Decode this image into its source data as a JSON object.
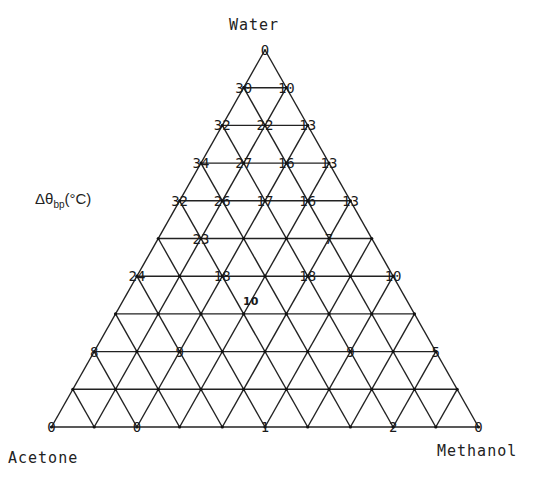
{
  "diagram": {
    "type": "ternary-grid",
    "subdivisions": 10,
    "line_color": "#222222",
    "vertices": {
      "top": "Water",
      "bottom_left": "Acetone",
      "bottom_right": "Methanol"
    },
    "axis_title": {
      "prefix": "Δθ",
      "subscript": "bp",
      "suffix": "(°C)"
    },
    "node_values": [
      {
        "row": 0,
        "col": 0,
        "value": "0"
      },
      {
        "row": 1,
        "col": 0,
        "value": "30"
      },
      {
        "row": 1,
        "col": 1,
        "value": "10"
      },
      {
        "row": 2,
        "col": 0,
        "value": "32"
      },
      {
        "row": 2,
        "col": 1,
        "value": "22"
      },
      {
        "row": 2,
        "col": 2,
        "value": "13"
      },
      {
        "row": 3,
        "col": 0,
        "value": "34"
      },
      {
        "row": 3,
        "col": 1,
        "value": "27"
      },
      {
        "row": 3,
        "col": 2,
        "value": "16"
      },
      {
        "row": 3,
        "col": 3,
        "value": "13"
      },
      {
        "row": 4,
        "col": 0,
        "value": "32"
      },
      {
        "row": 4,
        "col": 1,
        "value": "26"
      },
      {
        "row": 4,
        "col": 2,
        "value": "17"
      },
      {
        "row": 4,
        "col": 3,
        "value": "16"
      },
      {
        "row": 4,
        "col": 4,
        "value": "13"
      },
      {
        "row": 5,
        "col": 1,
        "value": "23"
      },
      {
        "row": 5,
        "col": 4,
        "value": "7"
      },
      {
        "row": 6,
        "col": 0,
        "value": "24"
      },
      {
        "row": 6,
        "col": 2,
        "value": "18"
      },
      {
        "row": 6,
        "col": 4,
        "value": "18"
      },
      {
        "row": 6,
        "col": 6,
        "value": "10"
      },
      {
        "row": 8,
        "col": 0,
        "value": "8"
      },
      {
        "row": 8,
        "col": 2,
        "value": "9"
      },
      {
        "row": 8,
        "col": 6,
        "value": "9"
      },
      {
        "row": 8,
        "col": 8,
        "value": "5"
      },
      {
        "row": 10,
        "col": 0,
        "value": "0"
      },
      {
        "row": 10,
        "col": 2,
        "value": "0"
      },
      {
        "row": 10,
        "col": 5,
        "value": "1"
      },
      {
        "row": 10,
        "col": 8,
        "value": "2"
      },
      {
        "row": 10,
        "col": 10,
        "value": "0"
      }
    ],
    "interior_values": [
      {
        "row": 6.67,
        "col": 3.0,
        "value": "10"
      }
    ]
  }
}
